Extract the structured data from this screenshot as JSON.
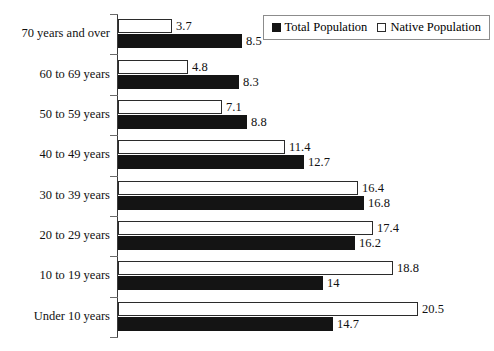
{
  "title_clipped": "",
  "legend": {
    "position": "top-right",
    "entries": [
      {
        "label": "Total Population",
        "swatch": "filled-square-icon",
        "color": "#141414"
      },
      {
        "label": "Native Population",
        "swatch": "hollow-square-icon",
        "color": "#ffffff"
      }
    ]
  },
  "chart_data": {
    "type": "bar",
    "orientation": "horizontal",
    "title": "",
    "xlabel": "",
    "ylabel": "",
    "grid": false,
    "legend_position": "top-right",
    "xlim": [
      0,
      20.5
    ],
    "categories": [
      "70 years and over",
      "60 to 69 years",
      "50 to 59 years",
      "40 to 49 years",
      "30 to 39 years",
      "20 to 29 years",
      "10 to 19 years",
      "Under 10 years"
    ],
    "series": [
      {
        "name": "Native Population",
        "values": [
          3.7,
          4.8,
          7.1,
          11.4,
          16.4,
          17.4,
          18.8,
          20.5
        ]
      },
      {
        "name": "Total Population",
        "values": [
          8.5,
          8.3,
          8.8,
          12.7,
          16.8,
          16.2,
          14,
          14.7
        ]
      }
    ],
    "value_labels": {
      "native": [
        "3.7",
        "4.8",
        "7.1",
        "11.4",
        "16.4",
        "17.4",
        "18.8",
        "20.5"
      ],
      "total": [
        "8.5",
        "8.3",
        "8.8",
        "12.7",
        "16.8",
        "16.2",
        "14",
        "14.7"
      ]
    }
  }
}
